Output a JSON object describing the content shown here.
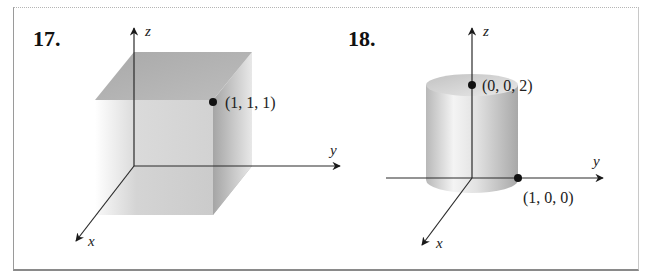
{
  "figures": [
    {
      "number": "17.",
      "solid": "cube",
      "axes": {
        "z": "z",
        "y": "y",
        "x": "x"
      },
      "points": [
        {
          "label": "(1, 1, 1)",
          "coords": [
            1,
            1,
            1
          ]
        }
      ]
    },
    {
      "number": "18.",
      "solid": "cylinder",
      "axes": {
        "z": "z",
        "y": "y",
        "x": "x"
      },
      "points": [
        {
          "label": "(0, 0, 2)",
          "coords": [
            0,
            0,
            2
          ]
        },
        {
          "label": "(1, 0, 0)",
          "coords": [
            1,
            0,
            0
          ]
        }
      ]
    }
  ],
  "colors": {
    "axis": "#2a2a2a",
    "solid_light": "#f2f2f2",
    "solid_mid": "#c4c4c4",
    "solid_dark": "#9c9c9c",
    "frame": "#9a9a9a"
  }
}
